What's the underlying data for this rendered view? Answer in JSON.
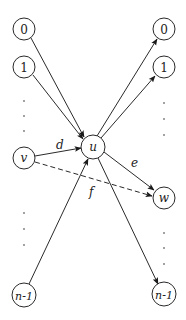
{
  "diagram": {
    "type": "directed-graph",
    "center_node": {
      "id": "u",
      "label": "u"
    },
    "left_nodes": [
      {
        "id": "L0",
        "label": "0"
      },
      {
        "id": "L1",
        "label": "1"
      },
      {
        "id": "v",
        "label": "v"
      },
      {
        "id": "Ln1",
        "label": "n-1"
      }
    ],
    "right_nodes": [
      {
        "id": "R0",
        "label": "0"
      },
      {
        "id": "R1",
        "label": "1"
      },
      {
        "id": "w",
        "label": "w"
      },
      {
        "id": "Rn1",
        "label": "n-1"
      }
    ],
    "edges": [
      {
        "from": "L0",
        "to": "u",
        "style": "solid"
      },
      {
        "from": "L1",
        "to": "u",
        "style": "solid"
      },
      {
        "from": "v",
        "to": "u",
        "style": "solid",
        "label": "d"
      },
      {
        "from": "Ln1",
        "to": "u",
        "style": "solid"
      },
      {
        "from": "u",
        "to": "R0",
        "style": "solid"
      },
      {
        "from": "u",
        "to": "R1",
        "style": "solid"
      },
      {
        "from": "u",
        "to": "w",
        "style": "solid",
        "label": "e"
      },
      {
        "from": "u",
        "to": "Rn1",
        "style": "solid"
      },
      {
        "from": "v",
        "to": "w",
        "style": "dashed",
        "label": "f"
      }
    ],
    "edge_labels": {
      "d": "d",
      "e": "e",
      "f": "f"
    },
    "colors": {
      "stroke": "#2a2a2a",
      "background": "#ffffff"
    }
  }
}
